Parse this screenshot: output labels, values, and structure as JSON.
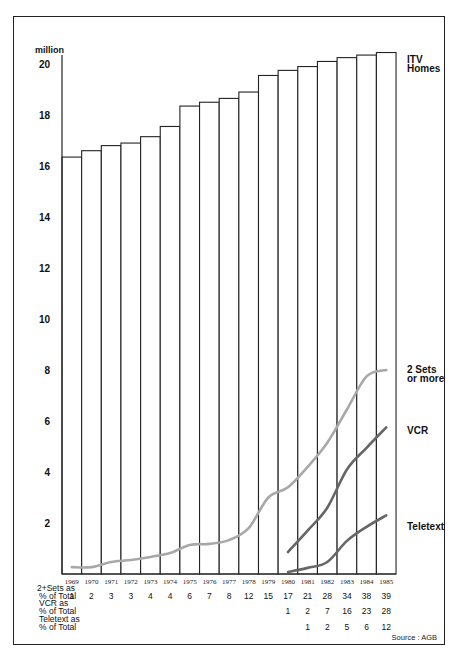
{
  "chart_data": {
    "type": "bar",
    "title": "",
    "ylabel": "million",
    "xlabel": "",
    "ylim": [
      0,
      20.6
    ],
    "yticks": [
      20,
      18,
      16,
      14,
      12,
      10,
      8,
      6,
      4,
      2
    ],
    "grid": false,
    "categories": [
      "1969",
      "1970",
      "1971",
      "1972",
      "1973",
      "1974",
      "1975",
      "1976",
      "1977",
      "1978",
      "1979",
      "1980",
      "1981",
      "1982",
      "1983",
      "1984",
      "1985"
    ],
    "series": [
      {
        "name": "ITV Homes",
        "type": "bar",
        "label_lines": [
          "ITV",
          "Homes"
        ],
        "color": "#ffffff",
        "values": [
          16.35,
          16.6,
          16.8,
          16.9,
          17.15,
          17.55,
          18.35,
          18.5,
          18.65,
          18.9,
          19.55,
          19.75,
          19.9,
          20.1,
          20.25,
          20.35,
          20.45
        ]
      },
      {
        "name": "2 Sets or more",
        "type": "line",
        "label_lines": [
          "2 Sets",
          "or more"
        ],
        "color": "#a8a8a8",
        "values": [
          0.27,
          0.27,
          0.47,
          0.55,
          0.67,
          0.82,
          1.14,
          1.18,
          1.33,
          1.8,
          3.0,
          3.4,
          4.2,
          5.15,
          6.45,
          7.75,
          8.0
        ]
      },
      {
        "name": "VCR",
        "type": "line",
        "label_lines": [
          "VCR"
        ],
        "color": "#666666",
        "values": [
          null,
          null,
          null,
          null,
          null,
          null,
          null,
          null,
          null,
          null,
          null,
          0.86,
          1.7,
          2.6,
          4.1,
          4.95,
          5.75
        ]
      },
      {
        "name": "Teletext",
        "type": "line",
        "label_lines": [
          "Teletext"
        ],
        "color": "#666666",
        "values": [
          null,
          null,
          null,
          null,
          null,
          null,
          null,
          null,
          null,
          null,
          null,
          0.08,
          0.24,
          0.47,
          1.3,
          1.85,
          2.3
        ]
      }
    ],
    "table": {
      "rows": [
        {
          "label_lines": [
            "2+Sets as",
            "% of Total"
          ],
          "values": [
            "1",
            "2",
            "3",
            "3",
            "4",
            "4",
            "6",
            "7",
            "8",
            "12",
            "15",
            "17",
            "21",
            "28",
            "34",
            "38",
            "39"
          ]
        },
        {
          "label_lines": [
            "VCR as",
            "% of Total"
          ],
          "values": [
            "",
            "",
            "",
            "",
            "",
            "",
            "",
            "",
            "",
            "",
            "",
            "1",
            "2",
            "7",
            "16",
            "23",
            "28"
          ]
        },
        {
          "label_lines": [
            "Teletext as",
            "% of Total"
          ],
          "values": [
            "",
            "",
            "",
            "",
            "",
            "",
            "",
            "",
            "",
            "",
            "",
            "",
            "1",
            "2",
            "5",
            "6",
            "12"
          ]
        }
      ]
    },
    "source": "Source : AGB"
  }
}
